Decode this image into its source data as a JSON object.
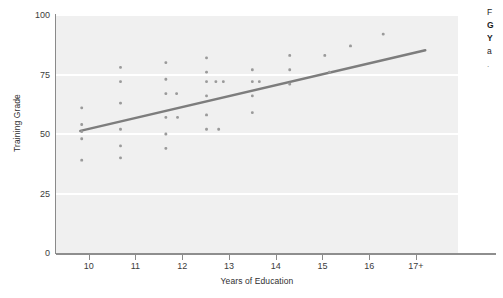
{
  "chart_data": {
    "type": "scatter",
    "title": "",
    "xlabel": "Years of Education",
    "ylabel": "Training Grade",
    "xlim": [
      9.3,
      17.9
    ],
    "ylim": [
      0,
      100
    ],
    "grid": true,
    "legend": "none",
    "xticks": [
      "10",
      "11",
      "12",
      "13",
      "14",
      "15",
      "16",
      "17+"
    ],
    "xtick_values": [
      10,
      11,
      12,
      13,
      14,
      15,
      16,
      17
    ],
    "yticks": [
      "0",
      "25",
      "50",
      "75",
      "100"
    ],
    "ytick_values": [
      0,
      25,
      50,
      75,
      100
    ],
    "point_color": "#9a9a9a",
    "line_color": "#7d7d7d",
    "panel_color": "#f0f0f0",
    "gridline_color": "#ffffff",
    "points": [
      {
        "x": 9.85,
        "y": 61
      },
      {
        "x": 9.85,
        "y": 54
      },
      {
        "x": 9.85,
        "y": 51
      },
      {
        "x": 9.85,
        "y": 48
      },
      {
        "x": 9.85,
        "y": 39
      },
      {
        "x": 10.68,
        "y": 78
      },
      {
        "x": 10.68,
        "y": 72
      },
      {
        "x": 10.68,
        "y": 63
      },
      {
        "x": 10.68,
        "y": 52
      },
      {
        "x": 10.68,
        "y": 45
      },
      {
        "x": 10.68,
        "y": 40
      },
      {
        "x": 11.65,
        "y": 80
      },
      {
        "x": 11.65,
        "y": 73
      },
      {
        "x": 11.65,
        "y": 67
      },
      {
        "x": 11.88,
        "y": 67
      },
      {
        "x": 11.65,
        "y": 57
      },
      {
        "x": 11.9,
        "y": 57
      },
      {
        "x": 11.65,
        "y": 50
      },
      {
        "x": 11.65,
        "y": 44
      },
      {
        "x": 12.52,
        "y": 82
      },
      {
        "x": 12.52,
        "y": 76
      },
      {
        "x": 12.52,
        "y": 72
      },
      {
        "x": 12.72,
        "y": 72
      },
      {
        "x": 12.88,
        "y": 72
      },
      {
        "x": 12.52,
        "y": 66
      },
      {
        "x": 12.52,
        "y": 58
      },
      {
        "x": 12.52,
        "y": 52
      },
      {
        "x": 12.78,
        "y": 52
      },
      {
        "x": 13.5,
        "y": 77
      },
      {
        "x": 13.5,
        "y": 72
      },
      {
        "x": 13.65,
        "y": 72
      },
      {
        "x": 13.5,
        "y": 66
      },
      {
        "x": 13.5,
        "y": 59
      },
      {
        "x": 14.3,
        "y": 83
      },
      {
        "x": 14.3,
        "y": 77
      },
      {
        "x": 14.3,
        "y": 71
      },
      {
        "x": 15.05,
        "y": 83
      },
      {
        "x": 15.15,
        "y": 76
      },
      {
        "x": 15.6,
        "y": 87
      },
      {
        "x": 16.3,
        "y": 92
      }
    ],
    "trendline": {
      "x_start": 9.82,
      "y_start": 51.3,
      "x_end": 17.2,
      "y_end": 85.2
    }
  },
  "caption": {
    "lines": [
      "F",
      "G",
      "Y",
      "a"
    ],
    "bullet": "."
  }
}
